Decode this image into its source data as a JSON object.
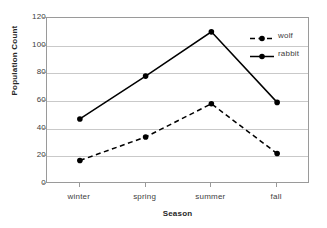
{
  "chart_data": {
    "type": "line",
    "title": "",
    "xlabel": "Season",
    "ylabel": "Population Count",
    "categories": [
      "winter",
      "spring",
      "summer",
      "fall"
    ],
    "series": [
      {
        "name": "wolf",
        "values": [
          17,
          34,
          58,
          22
        ],
        "line_style": "dashed",
        "marker": "filled-circle",
        "color": "#000000"
      },
      {
        "name": "rabbit",
        "values": [
          47,
          78,
          110,
          59
        ],
        "line_style": "solid",
        "marker": "filled-circle",
        "color": "#000000"
      }
    ],
    "ylim": [
      0,
      120
    ],
    "ytick_values": [
      0,
      20,
      40,
      60,
      80,
      100,
      120
    ],
    "ytick_labels": [
      "0",
      "20",
      "40",
      "60",
      "80",
      "100",
      "120"
    ],
    "grid": "horizontal",
    "legend_position": "inside-top-right",
    "axis_color": "#9a9a9a",
    "grid_color": "#c9c9c9",
    "background": "#ffffff"
  },
  "legend": {
    "entries": [
      {
        "label": "wolf"
      },
      {
        "label": "rabbit"
      }
    ]
  }
}
